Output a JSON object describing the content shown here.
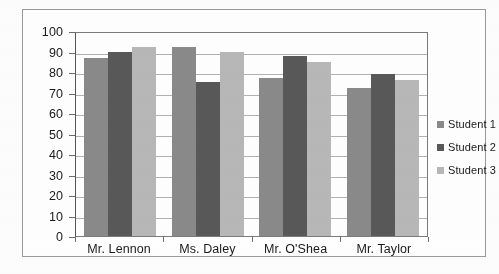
{
  "chart_data": {
    "type": "bar",
    "title": "",
    "xlabel": "",
    "ylabel": "",
    "ylim": [
      0,
      100
    ],
    "ytick_step": 10,
    "yticks": [
      "100",
      "90",
      "80",
      "70",
      "60",
      "50",
      "40",
      "30",
      "20",
      "10",
      "0"
    ],
    "grid": true,
    "legend_position": "right",
    "categories": [
      "Mr. Lennon",
      "Ms. Daley",
      "Mr. O'Shea",
      "Mr. Taylor"
    ],
    "series": [
      {
        "name": "Student 1",
        "color": "#8a8a8a",
        "values": [
          87,
          92,
          77,
          72
        ]
      },
      {
        "name": "Student 2",
        "color": "#595959",
        "values": [
          90,
          75,
          88,
          79
        ]
      },
      {
        "name": "Student 3",
        "color": "#b8b8b8",
        "values": [
          92,
          90,
          85,
          76
        ]
      }
    ]
  },
  "legend": {
    "items": [
      {
        "label": "Student 1",
        "color": "#8a8a8a"
      },
      {
        "label": "Student 2",
        "color": "#595959"
      },
      {
        "label": "Student 3",
        "color": "#b8b8b8"
      }
    ]
  },
  "colors": {
    "series_1": "#8a8a8a",
    "series_2": "#595959",
    "series_3": "#b8b8b8",
    "gridline": "#b2b2b2",
    "axis": "#6e6e6e",
    "frame": "#9a9a9a",
    "text": "#1a1a1a",
    "background": "#ffffff"
  }
}
